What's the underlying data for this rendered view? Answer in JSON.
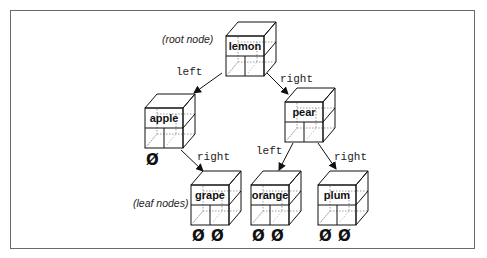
{
  "diagram": {
    "annotations": {
      "root": "(root node)",
      "leaves": "(leaf nodes)"
    },
    "nodes": [
      {
        "id": "lemon",
        "label": "lemon",
        "role": "root"
      },
      {
        "id": "apple",
        "label": "apple",
        "role": "internal"
      },
      {
        "id": "pear",
        "label": "pear",
        "role": "internal"
      },
      {
        "id": "grape",
        "label": "grape",
        "role": "leaf"
      },
      {
        "id": "orange",
        "label": "orange",
        "role": "leaf"
      },
      {
        "id": "plum",
        "label": "plum",
        "role": "leaf"
      }
    ],
    "edges": [
      {
        "from": "lemon",
        "to": "apple",
        "label": "left"
      },
      {
        "from": "lemon",
        "to": "pear",
        "label": "right"
      },
      {
        "from": "apple",
        "to": "grape",
        "label": "right"
      },
      {
        "from": "pear",
        "to": "orange",
        "label": "left"
      },
      {
        "from": "pear",
        "to": "plum",
        "label": "right"
      }
    ],
    "null_symbol": "Ø",
    "null_pointers": [
      {
        "node": "apple",
        "side": "left"
      },
      {
        "node": "grape",
        "side": "left"
      },
      {
        "node": "grape",
        "side": "right"
      },
      {
        "node": "orange",
        "side": "left"
      },
      {
        "node": "orange",
        "side": "right"
      },
      {
        "node": "plum",
        "side": "left"
      },
      {
        "node": "plum",
        "side": "right"
      }
    ]
  }
}
